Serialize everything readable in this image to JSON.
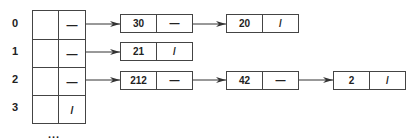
{
  "diagram": {
    "type": "hash-table-with-chaining",
    "buckets": [
      {
        "index": "0",
        "pointer": "—",
        "chain": [
          {
            "value": "30",
            "next": "—"
          },
          {
            "value": "20",
            "next": "/"
          }
        ]
      },
      {
        "index": "1",
        "pointer": "—",
        "chain": [
          {
            "value": "21",
            "next": "/"
          }
        ]
      },
      {
        "index": "2",
        "pointer": "—",
        "chain": [
          {
            "value": "212",
            "next": "—"
          },
          {
            "value": "42",
            "next": "—"
          },
          {
            "value": "2",
            "next": "/"
          }
        ]
      },
      {
        "index": "3",
        "pointer": "/",
        "chain": []
      }
    ],
    "ellipsis": "..."
  }
}
